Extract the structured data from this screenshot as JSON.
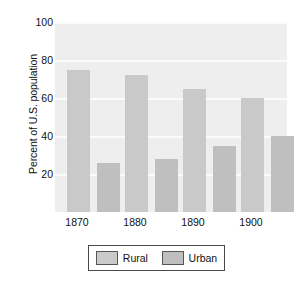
{
  "chart_data": {
    "type": "bar",
    "title": "",
    "subtitle": "",
    "xlabel": "",
    "ylabel": "Percent of U.S. population",
    "categories": [
      "1870",
      "1880",
      "1890",
      "1900"
    ],
    "series": [
      {
        "name": "Rural",
        "color": "#c9c9c9",
        "values": [
          75,
          72,
          65,
          60
        ]
      },
      {
        "name": "Urban",
        "color": "#bfbfbf",
        "values": [
          26,
          28,
          35,
          40
        ]
      }
    ],
    "ylim": [
      0,
      100
    ],
    "yticks": [
      "100",
      "80",
      "60",
      "40",
      "20"
    ],
    "ytick_values": [
      100,
      80,
      60,
      40,
      20
    ],
    "grid": true,
    "grid_color": "#fbfbfb",
    "plot_background": "#eeeeee",
    "legend_position": "bottom",
    "legend_entries": [
      "Rural",
      "Urban"
    ]
  }
}
